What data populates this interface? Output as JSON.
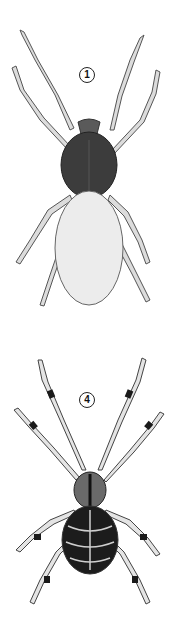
{
  "figure": {
    "specimens": [
      {
        "label": "1",
        "description": "Spider with dark glossy carapace, pale stippled oval abdomen, pale segmented legs"
      },
      {
        "label": "4",
        "description": "Orb-weaver spider with dark banded legs and dark patterned abdomen with pale markings"
      }
    ]
  },
  "colors": {
    "background": "#ffffff",
    "carapace_dark": "#3a3a3a",
    "abdomen_pale": "#ececec",
    "leg_pale": "#d8d8d8",
    "outline": "#444444",
    "band_dark": "#1a1a1a"
  }
}
